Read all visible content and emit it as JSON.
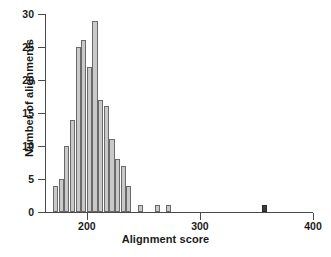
{
  "figure": {
    "background": "#ffffff",
    "bar_fill": "#c9c9c9",
    "bar_edge": "#6a6a6a",
    "highlight_fill": "#3a3a3a",
    "axis_color": "#4a4a4a"
  },
  "chart_data": {
    "type": "bar",
    "title": "",
    "xlabel": "Alignment score",
    "ylabel": "Number of alignments",
    "xlim": [
      163,
      400
    ],
    "ylim": [
      0,
      30
    ],
    "bin_width": 5,
    "grid": false,
    "legend": null,
    "xticks": [
      200,
      300,
      400
    ],
    "xtick_labels": [
      "200",
      "300",
      "400"
    ],
    "yticks": [
      0,
      5,
      10,
      15,
      20,
      25,
      30
    ],
    "ytick_labels": [
      "0",
      "5",
      "10",
      "15",
      "20",
      "25",
      "30"
    ],
    "bin_starts": [
      170,
      175,
      180,
      185,
      190,
      195,
      200,
      205,
      210,
      215,
      220,
      225,
      230,
      235,
      245,
      260,
      270,
      355
    ],
    "categories": [
      "170",
      "175",
      "180",
      "185",
      "190",
      "195",
      "200",
      "205",
      "210",
      "215",
      "220",
      "225",
      "230",
      "235",
      "245",
      "260",
      "270",
      "355"
    ],
    "values": [
      4,
      5,
      10,
      14,
      25,
      26,
      22,
      29,
      17,
      16,
      11,
      8,
      7,
      4,
      1,
      1,
      1,
      1
    ],
    "highlight_index": 17,
    "annotations": []
  }
}
